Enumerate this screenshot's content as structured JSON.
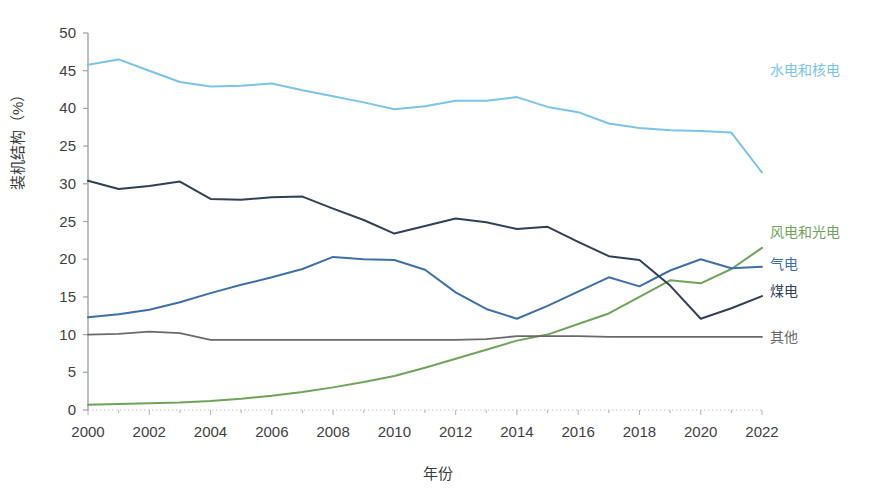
{
  "chart_data": {
    "type": "line",
    "title": "",
    "xlabel": "年份",
    "ylabel": "装机结构（%）",
    "x": [
      2000,
      2001,
      2002,
      2003,
      2004,
      2005,
      2006,
      2007,
      2008,
      2009,
      2010,
      2011,
      2012,
      2013,
      2014,
      2015,
      2016,
      2017,
      2018,
      2019,
      2020,
      2021,
      2022
    ],
    "xlim": [
      2000,
      2022
    ],
    "ylim": [
      0,
      50
    ],
    "ytick_labels": [
      "50",
      "45",
      "40",
      "25",
      "30",
      "25",
      "20",
      "15",
      "10",
      "5",
      "0"
    ],
    "ytick_values": [
      50,
      45,
      40,
      35,
      30,
      25,
      20,
      15,
      10,
      5,
      0
    ],
    "xtick_labels": [
      "2000",
      "2002",
      "2004",
      "2006",
      "2008",
      "2010",
      "2012",
      "2014",
      "2016",
      "2018",
      "2020",
      "2022"
    ],
    "xtick_values": [
      2000,
      2002,
      2004,
      2006,
      2008,
      2010,
      2012,
      2014,
      2016,
      2018,
      2020,
      2022
    ],
    "grid": false,
    "minor_ticks": true,
    "legend_position": "right-inline",
    "series": [
      {
        "name": "水电和核电",
        "color": "#79c4e8",
        "label_y": 45.0,
        "values": [
          45.8,
          46.5,
          45.0,
          43.5,
          42.9,
          43.0,
          43.3,
          42.4,
          41.6,
          40.8,
          39.9,
          40.3,
          41.0,
          41.0,
          41.5,
          40.2,
          39.5,
          38.0,
          37.4,
          37.1,
          37.0,
          36.8,
          31.5
        ]
      },
      {
        "name": "风电和光电",
        "color": "#6fa35a",
        "label_y": 23.5,
        "values": [
          0.7,
          0.8,
          0.9,
          1.0,
          1.2,
          1.5,
          1.9,
          2.4,
          3.0,
          3.7,
          4.5,
          5.6,
          6.8,
          8.0,
          9.2,
          10.0,
          11.4,
          12.8,
          15.0,
          17.2,
          16.8,
          18.7,
          21.5
        ]
      },
      {
        "name": "气电",
        "color": "#3d6fa8",
        "label_y": 19.2,
        "values": [
          12.3,
          12.7,
          13.3,
          14.3,
          15.5,
          16.6,
          17.6,
          18.7,
          20.3,
          20.0,
          19.9,
          18.6,
          15.6,
          13.4,
          12.1,
          13.8,
          15.7,
          17.6,
          16.4,
          18.5,
          20.0,
          18.8,
          19.0
        ]
      },
      {
        "name": "煤电",
        "color": "#2f4157",
        "label_y": 15.6,
        "values": [
          30.4,
          29.3,
          29.7,
          30.3,
          28.0,
          27.9,
          28.2,
          28.3,
          26.7,
          25.2,
          23.4,
          24.4,
          25.4,
          24.9,
          24.0,
          24.3,
          22.3,
          20.4,
          19.9,
          16.5,
          12.1,
          13.5,
          15.1
        ]
      },
      {
        "name": "其他",
        "color": "#6a6a6a",
        "label_y": 9.6,
        "values": [
          10.0,
          10.1,
          10.4,
          10.2,
          9.3,
          9.3,
          9.3,
          9.3,
          9.3,
          9.3,
          9.3,
          9.3,
          9.3,
          9.4,
          9.8,
          9.8,
          9.8,
          9.7,
          9.7,
          9.7,
          9.7,
          9.7,
          9.7
        ]
      }
    ]
  },
  "axes": {
    "y_title": "装机结构（%）",
    "x_title": "年份"
  }
}
